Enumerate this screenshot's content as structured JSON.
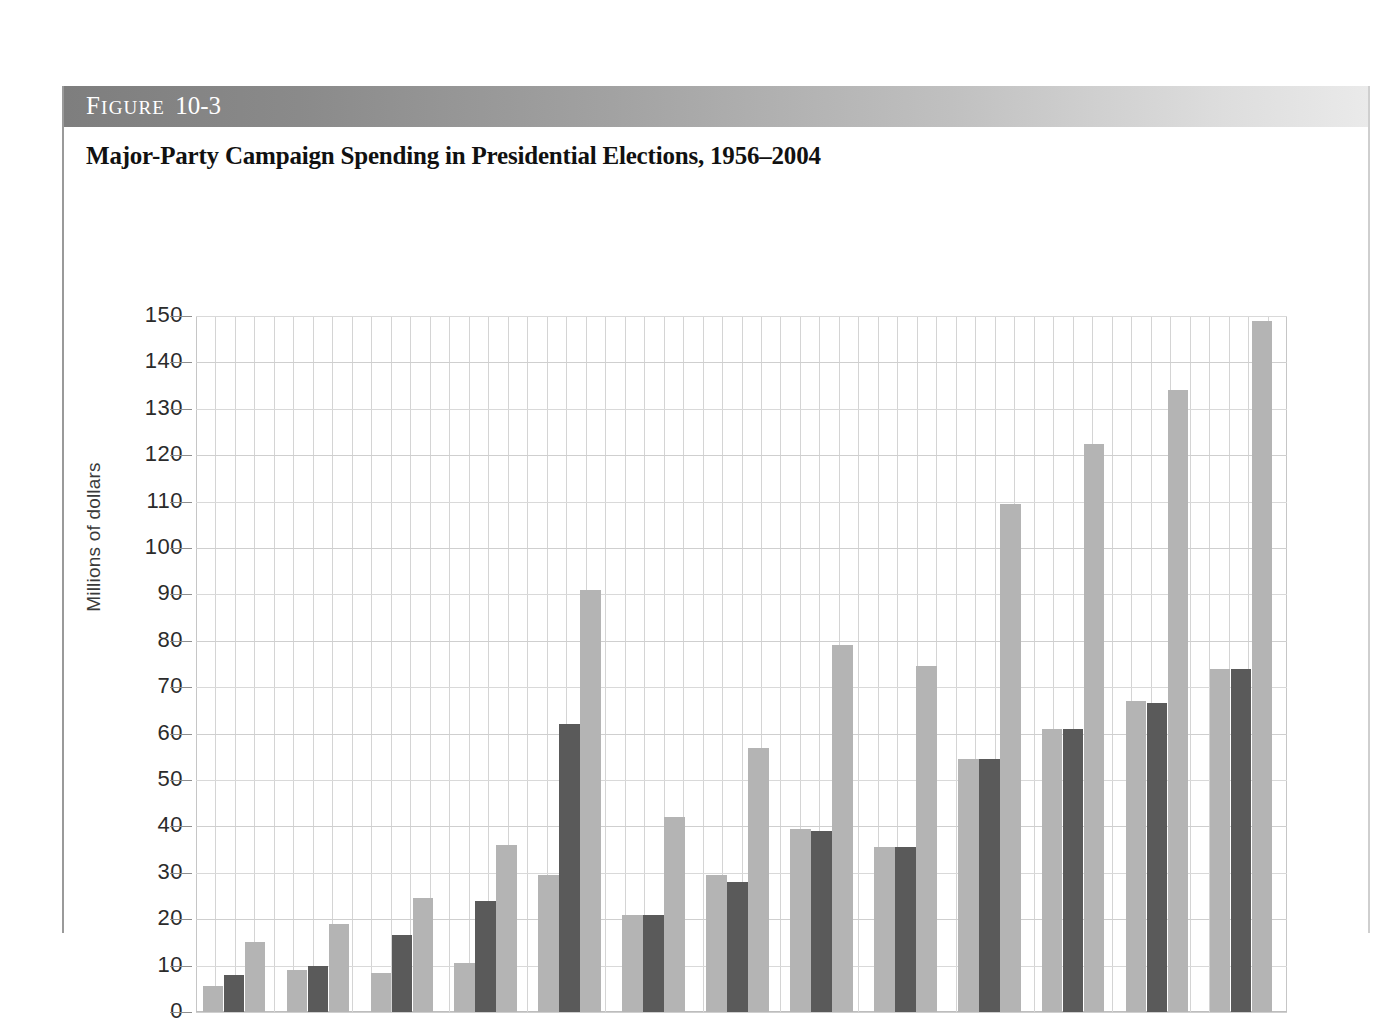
{
  "figure": {
    "header_prefix": "F",
    "header_word": "IGURE",
    "header_number": "10-3",
    "title": "Major-Party Campaign Spending in Presidential Elections, 1956–2004"
  },
  "colors": {
    "bar_light": "#b4b4b4",
    "bar_dark": "#5a5a5a",
    "grid": "#d4d4d4",
    "header_gradient_start": "#7e7e7e",
    "header_gradient_end": "#eaeaea",
    "text": "#2b2b2b"
  },
  "chart_data": {
    "type": "bar",
    "title": "Major-Party Campaign Spending in Presidential Elections, 1956–2004",
    "xlabel": "",
    "ylabel": "Millions of dollars",
    "ylim": [
      0,
      150
    ],
    "ytick_labels": [
      "150",
      "140",
      "130",
      "120",
      "110",
      "100",
      "90",
      "80",
      "70",
      "60",
      "50",
      "40",
      "30",
      "20",
      "10",
      "0"
    ],
    "ytick_values": [
      150,
      140,
      130,
      120,
      110,
      100,
      90,
      80,
      70,
      60,
      50,
      40,
      30,
      20,
      10,
      0
    ],
    "grid": true,
    "legend": "none",
    "categories": [
      "1956",
      "1960",
      "1964",
      "1968",
      "1972",
      "1976",
      "1980",
      "1984",
      "1988",
      "1992",
      "1996",
      "2000",
      "2004"
    ],
    "series": [
      {
        "name": "Democratic",
        "color": "#b4b4b4",
        "values": [
          5.5,
          9.0,
          8.5,
          10.5,
          29.5,
          21.0,
          29.5,
          39.5,
          35.5,
          54.5,
          61.0,
          67.0,
          74.0
        ]
      },
      {
        "name": "Republican",
        "color": "#5a5a5a",
        "values": [
          8.0,
          10.0,
          16.5,
          24.0,
          62.0,
          21.0,
          28.0,
          39.0,
          35.5,
          54.5,
          61.0,
          66.5,
          74.0
        ]
      },
      {
        "name": "Total",
        "color": "#b4b4b4",
        "values": [
          15.0,
          19.0,
          24.5,
          36.0,
          91.0,
          42.0,
          57.0,
          79.0,
          74.5,
          109.5,
          122.5,
          134.0,
          149.0
        ]
      }
    ]
  }
}
